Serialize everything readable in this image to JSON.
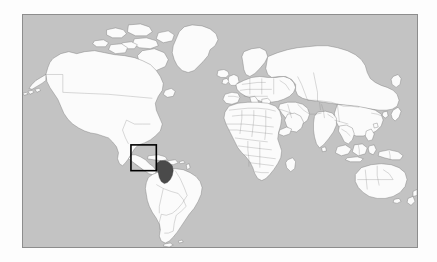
{
  "figure": {
    "title": "World location map",
    "type": "locator-map",
    "projection": "equirectangular",
    "frame": {
      "x": 22,
      "y": 14,
      "width": 396,
      "height": 234,
      "border_color": "#8d8d8d"
    },
    "colors": {
      "ocean": "#c3c3c3",
      "land": "#fbfbfb",
      "land_border": "#6f6f6f",
      "country_border": "#8a8a8a",
      "highlight_fill": "#4a4a4a",
      "highlight_border": "#303030",
      "inset_box_stroke": "#000000",
      "page_background": "#fdfdfd"
    }
  },
  "chart_data": {
    "type": "map",
    "title": "",
    "xlabel": "",
    "ylabel": "",
    "grid": false,
    "legend": "none",
    "xlim": [
      -180,
      180
    ],
    "ylim": [
      -90,
      90
    ],
    "highlight": {
      "label": "Colombia",
      "region": "Northwestern South America",
      "fill": "#4a4a4a",
      "centroid_lon": -73.0,
      "centroid_lat": 4.0
    },
    "inset_box": {
      "label": "study-area-box",
      "lon_min": -81.5,
      "lon_max": -66.0,
      "lat_min": -5.5,
      "lat_max": 14.5,
      "stroke": "#000000",
      "stroke_width": 1.6
    },
    "continents": [
      "North America",
      "South America",
      "Greenland",
      "Europe",
      "Africa",
      "Asia",
      "Australia",
      "Oceania"
    ]
  },
  "labels": {
    "map_region_name": "world-basemap",
    "highlight_region_name": "highlighted-country",
    "inset_name": "inset-rectangle",
    "frame_name": "map-border-frame"
  }
}
